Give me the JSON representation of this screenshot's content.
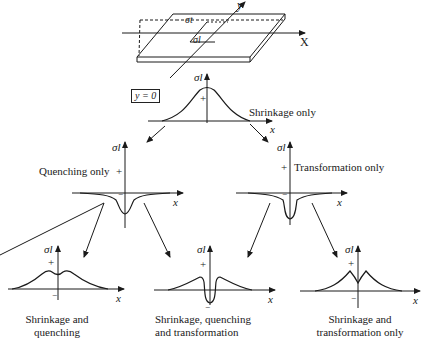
{
  "figure": {
    "plate": {
      "x_axis_label": "X",
      "y_axis_label": "y",
      "sigma_t_label": "σt",
      "sigma_l_label": "σl"
    },
    "section_label": "y = 0",
    "top_plot": {
      "y_label": "σl",
      "x_label": "x",
      "sign": "+",
      "caption": "Shrinkage only"
    },
    "middle_left_plot": {
      "y_label": "σl",
      "x_label": "x",
      "sign_pos": "+",
      "sign_neg": "−",
      "caption": "Quenching only"
    },
    "middle_right_plot": {
      "y_label": "σl",
      "x_label": "x",
      "sign_pos": "+",
      "sign_neg": "−",
      "caption": "Transformation only"
    },
    "bottom_left_plot": {
      "y_label": "σl",
      "x_label": "x",
      "sign_pos": "+",
      "sign_neg": "−",
      "caption_line1": "Shrinkage and",
      "caption_line2": "quenching"
    },
    "bottom_center_plot": {
      "y_label": "σl",
      "x_label": "x",
      "sign_pos": "+",
      "sign_neg": "−",
      "caption_line1": "Shrinkage, quenching",
      "caption_line2": "and transformation"
    },
    "bottom_right_plot": {
      "y_label": "σl",
      "x_label": "x",
      "sign_pos": "+",
      "sign_neg": "−",
      "caption_line1": "Shrinkage and",
      "caption_line2": "transformation only"
    }
  }
}
